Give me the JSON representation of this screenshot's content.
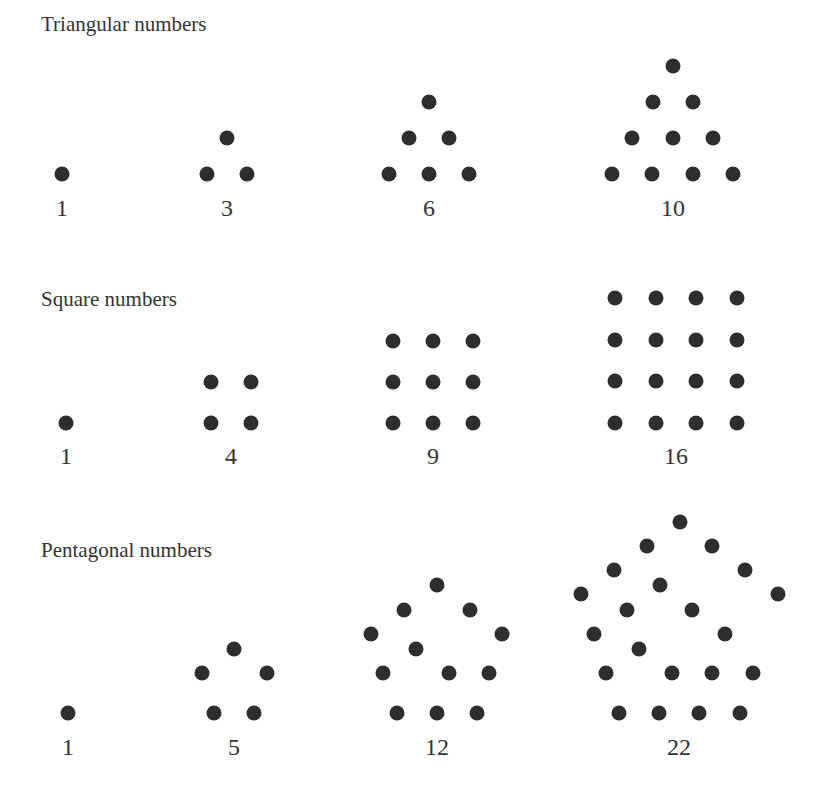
{
  "sections": [
    {
      "title": "Triangular numbers",
      "title_pos": [
        41,
        12
      ],
      "figures": [
        {
          "label": "1",
          "label_pos": [
            62,
            195
          ],
          "dots": [
            [
              62,
              174
            ]
          ]
        },
        {
          "label": "3",
          "label_pos": [
            227,
            195
          ],
          "dots": [
            [
              227,
              138
            ],
            [
              207,
              174
            ],
            [
              247,
              174
            ]
          ]
        },
        {
          "label": "6",
          "label_pos": [
            429,
            195
          ],
          "dots": [
            [
              429,
              102
            ],
            [
              409,
              138
            ],
            [
              449,
              138
            ],
            [
              389,
              174
            ],
            [
              429,
              174
            ],
            [
              469,
              174
            ]
          ]
        },
        {
          "label": "10",
          "label_pos": [
            673,
            195
          ],
          "dots": [
            [
              673,
              66
            ],
            [
              653,
              102
            ],
            [
              693,
              102
            ],
            [
              632,
              138
            ],
            [
              673,
              138
            ],
            [
              713,
              138
            ],
            [
              612,
              174
            ],
            [
              652,
              174
            ],
            [
              693,
              174
            ],
            [
              733,
              174
            ]
          ]
        }
      ]
    },
    {
      "title": "Square numbers",
      "title_pos": [
        41,
        287
      ],
      "figures": [
        {
          "label": "1",
          "label_pos": [
            66,
            443
          ],
          "dots": [
            [
              66,
              423
            ]
          ]
        },
        {
          "label": "4",
          "label_pos": [
            231,
            443
          ],
          "dots": [
            [
              211,
              382
            ],
            [
              251,
              382
            ],
            [
              211,
              423
            ],
            [
              251,
              423
            ]
          ]
        },
        {
          "label": "9",
          "label_pos": [
            433,
            443
          ],
          "dots": [
            [
              393,
              341
            ],
            [
              433,
              341
            ],
            [
              473,
              341
            ],
            [
              393,
              382
            ],
            [
              433,
              382
            ],
            [
              473,
              382
            ],
            [
              393,
              423
            ],
            [
              433,
              423
            ],
            [
              473,
              423
            ]
          ]
        },
        {
          "label": "16",
          "label_pos": [
            676,
            443
          ],
          "dots": [
            [
              615,
              298
            ],
            [
              656,
              298
            ],
            [
              696,
              298
            ],
            [
              737,
              298
            ],
            [
              615,
              340
            ],
            [
              656,
              340
            ],
            [
              696,
              340
            ],
            [
              737,
              340
            ],
            [
              615,
              381
            ],
            [
              656,
              381
            ],
            [
              696,
              381
            ],
            [
              737,
              381
            ],
            [
              615,
              423
            ],
            [
              656,
              423
            ],
            [
              696,
              423
            ],
            [
              737,
              423
            ]
          ]
        }
      ]
    },
    {
      "title": "Pentagonal numbers",
      "title_pos": [
        41,
        538
      ],
      "figures": [
        {
          "label": "1",
          "label_pos": [
            68,
            734
          ],
          "dots": [
            [
              68,
              713
            ]
          ]
        },
        {
          "label": "5",
          "label_pos": [
            234,
            734
          ],
          "dots": [
            [
              234,
              649
            ],
            [
              202,
              673
            ],
            [
              267,
              673
            ],
            [
              214,
              713
            ],
            [
              254,
              713
            ]
          ]
        },
        {
          "label": "12",
          "label_pos": [
            437,
            734
          ],
          "dots": [
            [
              437,
              585
            ],
            [
              404,
              610
            ],
            [
              470,
              610
            ],
            [
              371,
              634
            ],
            [
              502,
              634
            ],
            [
              416,
              649
            ],
            [
              383,
              673
            ],
            [
              449,
              673
            ],
            [
              489,
              673
            ],
            [
              397,
              713
            ],
            [
              437,
              713
            ],
            [
              477,
              713
            ]
          ]
        },
        {
          "label": "22",
          "label_pos": [
            679,
            734
          ],
          "dots": [
            [
              680,
              522
            ],
            [
              647,
              546
            ],
            [
              712,
              546
            ],
            [
              614,
              570
            ],
            [
              745,
              570
            ],
            [
              660,
              585
            ],
            [
              581,
              594
            ],
            [
              778,
              594
            ],
            [
              627,
              610
            ],
            [
              692,
              610
            ],
            [
              594,
              634
            ],
            [
              725,
              634
            ],
            [
              639,
              649
            ],
            [
              606,
              673
            ],
            [
              672,
              673
            ],
            [
              712,
              673
            ],
            [
              753,
              673
            ],
            [
              619,
              713
            ],
            [
              659,
              713
            ],
            [
              699,
              713
            ],
            [
              740,
              713
            ]
          ]
        }
      ]
    }
  ],
  "dot_radius": 7.5,
  "dot_color": "#2e2e2e"
}
